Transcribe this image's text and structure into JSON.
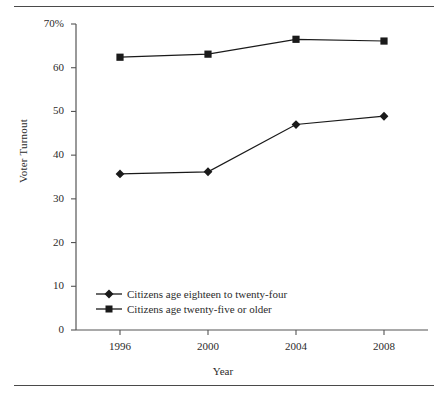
{
  "figure": {
    "top_rule": "horizontal-rule",
    "bottom_rule": "horizontal-rule"
  },
  "chart_data": {
    "type": "line",
    "title": "",
    "subtitle": "",
    "xlabel": "Year",
    "ylabel": "Voter Turnout",
    "categories": [
      "1996",
      "2000",
      "2004",
      "2008"
    ],
    "x": [
      1996,
      2000,
      2004,
      2008
    ],
    "xlim": [
      1994,
      2010
    ],
    "ylim": [
      0,
      70
    ],
    "yticks": [
      0,
      10,
      20,
      30,
      40,
      50,
      60,
      70
    ],
    "ytick_labels": [
      "0",
      "10",
      "20",
      "30",
      "40",
      "50",
      "60",
      "70%"
    ],
    "xtick_labels": [
      "1996",
      "2000",
      "2004",
      "2008"
    ],
    "grid": false,
    "legend_position": "inside-lower-left",
    "series": [
      {
        "name": "Citizens age eighteen to twenty-four",
        "marker": "diamond",
        "color": "#1a1a1a",
        "values": [
          35.7,
          36.2,
          47.0,
          48.9
        ]
      },
      {
        "name": "Citizens age twenty-five or older",
        "marker": "square",
        "color": "#1a1a1a",
        "values": [
          62.4,
          63.1,
          66.5,
          66.1
        ]
      }
    ]
  },
  "axis": {
    "y_label": "Voter Turnout",
    "x_label": "Year",
    "y_ticks": [
      {
        "label": "70%",
        "value": 70
      },
      {
        "label": "60",
        "value": 60
      },
      {
        "label": "50",
        "value": 50
      },
      {
        "label": "40",
        "value": 40
      },
      {
        "label": "30",
        "value": 30
      },
      {
        "label": "20",
        "value": 20
      },
      {
        "label": "10",
        "value": 10
      },
      {
        "label": "0",
        "value": 0
      }
    ],
    "x_ticks": [
      {
        "label": "1996",
        "value": 1996
      },
      {
        "label": "2000",
        "value": 2000
      },
      {
        "label": "2004",
        "value": 2004
      },
      {
        "label": "2008",
        "value": 2008
      }
    ]
  },
  "legend": {
    "items": [
      {
        "label": "Citizens age eighteen to twenty-four",
        "marker": "diamond"
      },
      {
        "label": "Citizens age twenty-five or older",
        "marker": "square"
      }
    ]
  },
  "colors": {
    "line": "#1a1a1a",
    "axis": "#555555",
    "rule": "#4a4a4a",
    "text": "#2b2b2b",
    "background": "#ffffff"
  }
}
